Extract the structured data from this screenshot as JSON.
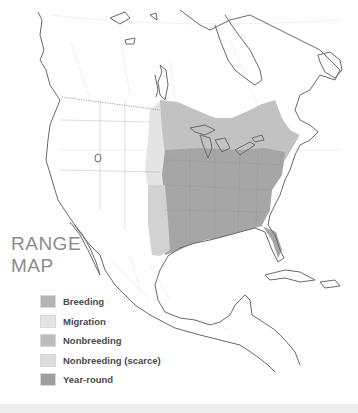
{
  "map": {
    "title_line1": "RANGE",
    "title_line2": "MAP",
    "region": "North America",
    "colors": {
      "background": "#ffffff",
      "coastline": "#6a6a6a",
      "borders": "#cfcfcf",
      "breeding": "#b4b4b4",
      "migration": "#e4e4e4",
      "nonbreeding": "#bdbdbd",
      "nonbreeding_scarce": "#dcdcdc",
      "year_round": "#9e9e9e"
    }
  },
  "legend": {
    "items": [
      {
        "label": "Breeding",
        "color": "#b4b4b4"
      },
      {
        "label": "Migration",
        "color": "#e4e4e4"
      },
      {
        "label": "Nonbreeding",
        "color": "#bdbdbd"
      },
      {
        "label": "Nonbreeding (scarce)",
        "color": "#dcdcdc"
      },
      {
        "label": "Year-round",
        "color": "#9e9e9e"
      }
    ]
  }
}
